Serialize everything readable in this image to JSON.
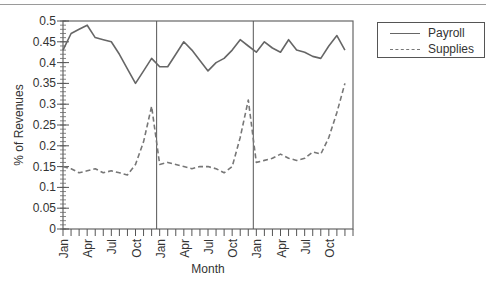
{
  "chart_data": {
    "type": "line",
    "title": "",
    "xlabel": "Month",
    "ylabel": "% of Revenues",
    "ylim": [
      0,
      0.5
    ],
    "yticks": [
      0,
      0.05,
      0.1,
      0.15,
      0.2,
      0.25,
      0.3,
      0.35,
      0.4,
      0.45,
      0.5
    ],
    "ytick_labels": [
      "0",
      "0.05",
      "0.1",
      "0.15",
      "0.2",
      "0.25",
      "0.3",
      "0.35",
      "0.4",
      "0.45",
      "0.5"
    ],
    "x_tick_labels": [
      "Jan",
      "Apr",
      "Jul",
      "Oct",
      "Jan",
      "Apr",
      "Jul",
      "Oct",
      "Jan",
      "Apr",
      "Jul",
      "Oct"
    ],
    "x": [
      "Jan",
      "Feb",
      "Mar",
      "Apr",
      "May",
      "Jun",
      "Jul",
      "Aug",
      "Sep",
      "Oct",
      "Nov",
      "Dec",
      "Jan",
      "Feb",
      "Mar",
      "Apr",
      "May",
      "Jun",
      "Jul",
      "Aug",
      "Sep",
      "Oct",
      "Nov",
      "Dec",
      "Jan",
      "Feb",
      "Mar",
      "Apr",
      "May",
      "Jun",
      "Jul",
      "Aug",
      "Sep",
      "Oct",
      "Nov",
      "Dec"
    ],
    "year_separators_after_index": [
      11,
      23
    ],
    "grid": false,
    "legend_position": "upper right, outside plot",
    "series": [
      {
        "name": "Payroll",
        "style": "solid",
        "color": "#666666",
        "values": [
          0.43,
          0.47,
          0.48,
          0.49,
          0.46,
          0.455,
          0.45,
          0.42,
          0.385,
          0.35,
          0.38,
          0.41,
          0.39,
          0.39,
          0.42,
          0.45,
          0.43,
          0.405,
          0.38,
          0.4,
          0.41,
          0.43,
          0.455,
          0.44,
          0.425,
          0.45,
          0.435,
          0.425,
          0.455,
          0.43,
          0.425,
          0.415,
          0.41,
          0.44,
          0.465,
          0.43
        ]
      },
      {
        "name": "Supplies",
        "style": "dashed",
        "color": "#777777",
        "values": [
          0.15,
          0.145,
          0.135,
          0.14,
          0.145,
          0.135,
          0.14,
          0.135,
          0.13,
          0.155,
          0.21,
          0.295,
          0.155,
          0.16,
          0.155,
          0.15,
          0.145,
          0.15,
          0.15,
          0.145,
          0.135,
          0.15,
          0.22,
          0.31,
          0.16,
          0.165,
          0.17,
          0.18,
          0.17,
          0.165,
          0.17,
          0.185,
          0.18,
          0.22,
          0.28,
          0.35
        ]
      }
    ]
  },
  "legend": {
    "items": [
      {
        "label": "Payroll",
        "style": "solid"
      },
      {
        "label": "Supplies",
        "style": "dashed"
      }
    ]
  },
  "axes": {
    "xlabel": "Month",
    "ylabel": "% of Revenues"
  }
}
